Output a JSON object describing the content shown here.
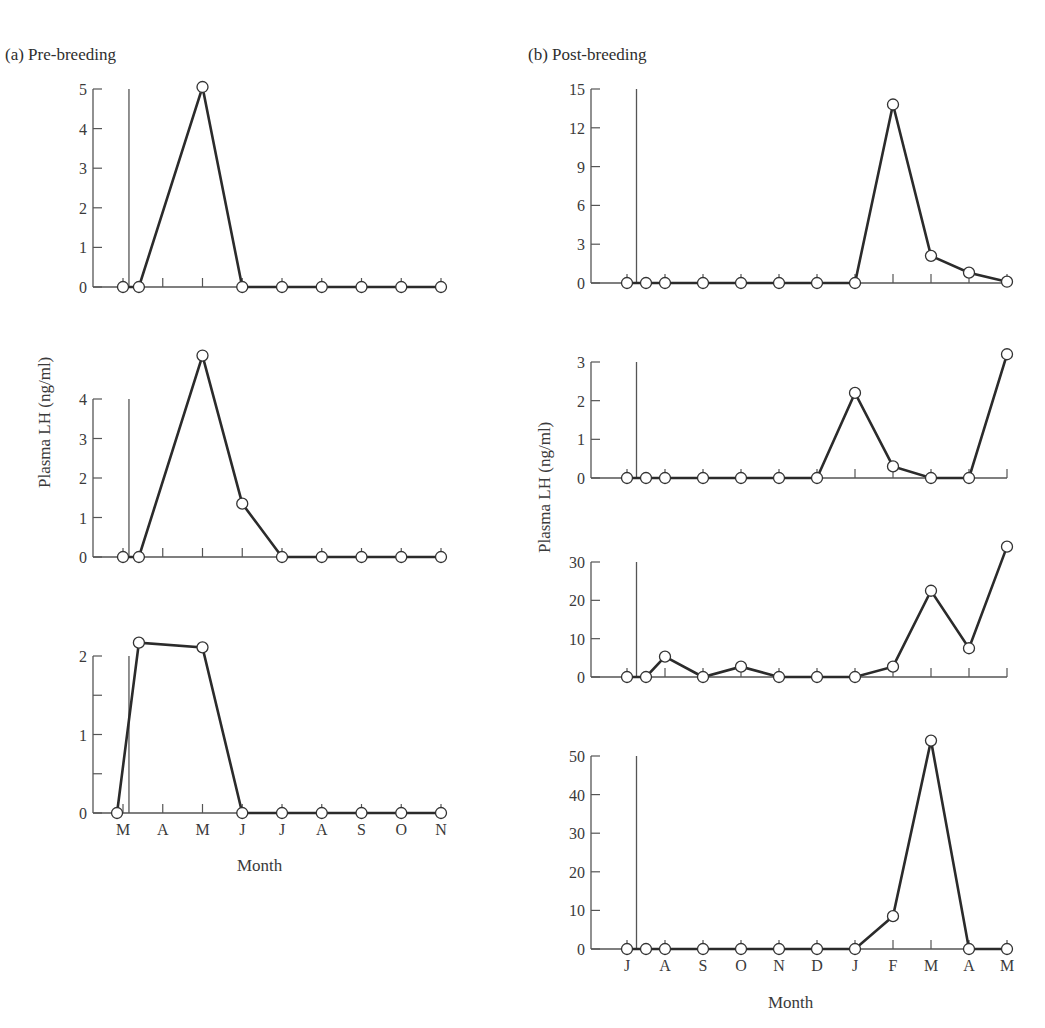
{
  "figure": {
    "panel_a_title": "(a)  Pre-breeding",
    "panel_b_title": "(b)  Post-breeding",
    "panel_a_ylabel": "Plasma LH (ng/ml)",
    "panel_b_ylabel": "Plasma LH (ng/ml)",
    "panel_a_xlabel": "Month",
    "panel_b_xlabel": "Month",
    "line_color": "#2b2b2b",
    "axis_color": "#555555"
  },
  "chart_data": [
    {
      "type": "line",
      "panel": "a1",
      "title": "(a) Pre-breeding",
      "xlabel": "",
      "ylabel": "",
      "categories": [
        "M",
        "A",
        "M",
        "J",
        "J",
        "A",
        "S",
        "O",
        "N"
      ],
      "x": [
        0,
        0.4,
        2,
        3,
        4,
        5,
        6,
        7,
        8
      ],
      "values": [
        0,
        0,
        5.05,
        0,
        0,
        0,
        0,
        0,
        0
      ],
      "yticks": [
        0,
        1,
        2,
        3,
        4,
        5
      ],
      "ylim": [
        0,
        5
      ],
      "marker_line_x": 0.15,
      "grid": false
    },
    {
      "type": "line",
      "panel": "a2",
      "xlabel": "",
      "ylabel": "Plasma LH (ng/ml)",
      "categories": [
        "M",
        "A",
        "M",
        "J",
        "J",
        "A",
        "S",
        "O",
        "N"
      ],
      "x": [
        0,
        0.4,
        2,
        3,
        4,
        5,
        6,
        7,
        8
      ],
      "values": [
        0,
        0,
        5.1,
        1.35,
        0,
        0,
        0,
        0,
        0
      ],
      "yticks": [
        0,
        1,
        2,
        3,
        4
      ],
      "ylim": [
        0,
        4
      ],
      "marker_line_x": 0.15,
      "grid": false
    },
    {
      "type": "line",
      "panel": "a3",
      "xlabel": "Month",
      "ylabel": "",
      "categories": [
        "M",
        "A",
        "M",
        "J",
        "J",
        "A",
        "S",
        "O",
        "N"
      ],
      "x": [
        -0.15,
        0.4,
        2,
        3,
        4,
        5,
        6,
        7,
        8
      ],
      "values": [
        0,
        2.17,
        2.11,
        0,
        0,
        0,
        0,
        0,
        0
      ],
      "yticks": [
        0,
        1,
        2
      ],
      "yminor": [
        0.5,
        1.5
      ],
      "ylim": [
        0,
        2
      ],
      "marker_line_x": 0.15,
      "grid": false
    },
    {
      "type": "line",
      "panel": "b1",
      "title": "(b) Post-breeding",
      "xlabel": "",
      "ylabel": "",
      "categories": [
        "J",
        "A",
        "S",
        "O",
        "N",
        "D",
        "J",
        "F",
        "M",
        "A",
        "M"
      ],
      "x": [
        0,
        0.5,
        1,
        2,
        3,
        4,
        5,
        6,
        7,
        8,
        9,
        10
      ],
      "values": [
        0,
        0,
        0,
        0,
        0,
        0,
        0,
        0,
        13.8,
        2.1,
        0.8,
        0.1
      ],
      "yticks": [
        0,
        3,
        6,
        9,
        12,
        15
      ],
      "ylim": [
        0,
        15
      ],
      "marker_line_x": 0.25,
      "grid": false
    },
    {
      "type": "line",
      "panel": "b2",
      "xlabel": "",
      "ylabel": "",
      "categories": [
        "J",
        "A",
        "S",
        "O",
        "N",
        "D",
        "J",
        "F",
        "M",
        "A",
        "M"
      ],
      "x": [
        0,
        0.5,
        1,
        2,
        3,
        4,
        5,
        6,
        7,
        8,
        9,
        10
      ],
      "values": [
        0,
        0,
        0,
        0,
        0,
        0,
        0,
        2.2,
        0.3,
        0,
        0,
        3.2
      ],
      "yticks": [
        0,
        1,
        2,
        3
      ],
      "ylim": [
        0,
        3
      ],
      "marker_line_x": 0.25,
      "grid": false
    },
    {
      "type": "line",
      "panel": "b3",
      "xlabel": "",
      "ylabel": "Plasma LH (ng/ml)",
      "categories": [
        "J",
        "A",
        "S",
        "O",
        "N",
        "D",
        "J",
        "F",
        "M",
        "A",
        "M"
      ],
      "x": [
        0,
        0.5,
        1,
        2,
        3,
        4,
        5,
        6,
        7,
        8,
        9,
        10
      ],
      "values": [
        0,
        0,
        5.3,
        0,
        2.7,
        0,
        0,
        0,
        2.7,
        22.5,
        7.5,
        34
      ],
      "yticks": [
        0,
        10,
        20,
        30
      ],
      "ylim": [
        0,
        30
      ],
      "marker_line_x": 0.25,
      "grid": false
    },
    {
      "type": "line",
      "panel": "b4",
      "xlabel": "Month",
      "ylabel": "",
      "categories": [
        "J",
        "A",
        "S",
        "O",
        "N",
        "D",
        "J",
        "F",
        "M",
        "A",
        "M"
      ],
      "x": [
        0,
        0.5,
        1,
        2,
        3,
        4,
        5,
        6,
        7,
        8,
        9,
        10
      ],
      "values": [
        0,
        0,
        0,
        0,
        0,
        0,
        0,
        0,
        8.5,
        54,
        0,
        0
      ],
      "yticks": [
        0,
        10,
        20,
        30,
        40,
        50
      ],
      "ylim": [
        0,
        50
      ],
      "marker_line_x": 0.25,
      "grid": false
    }
  ]
}
